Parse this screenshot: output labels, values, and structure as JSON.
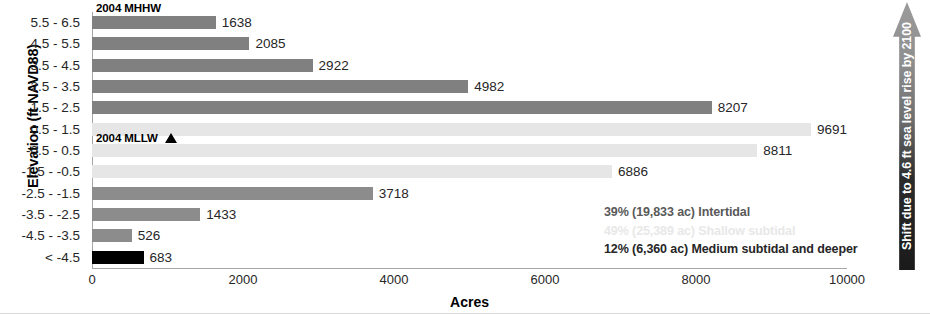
{
  "chart_data": {
    "type": "bar",
    "orientation": "horizontal",
    "title": "",
    "xlabel": "Acres",
    "ylabel": "Elevation (ft NAVD88)",
    "xlim": [
      0,
      10000
    ],
    "xticks": [
      0,
      2000,
      4000,
      6000,
      8000,
      10000
    ],
    "xtick_labels": [
      "0",
      "2000",
      "4000",
      "6000",
      "8000",
      "10000"
    ],
    "grid": false,
    "legend_position": "inside-bottom-right",
    "categories": [
      "5.5 - 6.5",
      "4.5 - 5.5",
      "3.5 - 4.5",
      "2.5 - 3.5",
      "1.5 - 2.5",
      "0.5 - 1.5",
      "-0.5 - 0.5",
      "-1.5 - -0.5",
      "-2.5 - -1.5",
      "-3.5 - -2.5",
      "-4.5 - -3.5",
      "< -4.5"
    ],
    "values": [
      1638,
      2085,
      2922,
      4982,
      8207,
      9691,
      8811,
      6886,
      3718,
      1433,
      526,
      683
    ],
    "value_labels": [
      "1638",
      "2085",
      "2922",
      "4982",
      "8207",
      "9691",
      "8811",
      "6886",
      "3718",
      "1433",
      "526",
      "683"
    ],
    "bar_colors": [
      "#808080",
      "#808080",
      "#808080",
      "#808080",
      "#808080",
      "#e6e6e6",
      "#e6e6e6",
      "#e6e6e6",
      "#8c8c8c",
      "#8c8c8c",
      "#8c8c8c",
      "#000000"
    ],
    "annotations": [
      {
        "text": "2004 MHHW",
        "marker": "none"
      },
      {
        "text": "2004 MLLW",
        "marker": "triangle-up"
      }
    ],
    "legend": [
      {
        "label": "39% (19,833 ac) Intertidal",
        "color": "#595959"
      },
      {
        "label": "49% (25,389 ac) Shallow subtidal",
        "color": "#e8e8e8"
      },
      {
        "label": "12% (6,360 ac) Medium subtidal and deeper",
        "color": "#262626"
      }
    ],
    "callout_banner": "Shift due to 4.6 ft sea level rise by 2100"
  },
  "axes": {
    "y_title": "Elevation (ft NAVD88)",
    "x_title": "Acres"
  },
  "banner": {
    "text": "Shift due to 4.6 ft sea level rise by 2100"
  },
  "datum_notes": {
    "mhhw": "2004 MHHW",
    "mllw": "2004 MLLW"
  }
}
